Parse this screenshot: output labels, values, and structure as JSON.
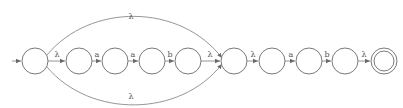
{
  "diagram": {
    "type": "finite-automaton",
    "colors": {
      "stroke": "#7a7a7a",
      "label": "#555555",
      "background": "#ffffff"
    },
    "states": [
      {
        "id": "q0",
        "cx": 35,
        "cy": 61,
        "initial": true,
        "final": false
      },
      {
        "id": "q1",
        "cx": 79,
        "cy": 61,
        "initial": false,
        "final": false
      },
      {
        "id": "q2",
        "cx": 115,
        "cy": 61,
        "initial": false,
        "final": false
      },
      {
        "id": "q3",
        "cx": 152,
        "cy": 61,
        "initial": false,
        "final": false
      },
      {
        "id": "q4",
        "cx": 188,
        "cy": 61,
        "initial": false,
        "final": false
      },
      {
        "id": "q5",
        "cx": 234,
        "cy": 61,
        "initial": false,
        "final": false
      },
      {
        "id": "q6",
        "cx": 272,
        "cy": 61,
        "initial": false,
        "final": false
      },
      {
        "id": "q7",
        "cx": 309,
        "cy": 61,
        "initial": false,
        "final": false
      },
      {
        "id": "q8",
        "cx": 345,
        "cy": 61,
        "initial": false,
        "final": false
      },
      {
        "id": "q9",
        "cx": 384,
        "cy": 61,
        "initial": false,
        "final": true
      }
    ],
    "transitions": [
      {
        "from": "q0",
        "to": "q1",
        "label": "λ"
      },
      {
        "from": "q1",
        "to": "q2",
        "label": "a"
      },
      {
        "from": "q2",
        "to": "q3",
        "label": "a"
      },
      {
        "from": "q3",
        "to": "q4",
        "label": "b"
      },
      {
        "from": "q4",
        "to": "q5",
        "label": "λ"
      },
      {
        "from": "q5",
        "to": "q6",
        "label": "λ"
      },
      {
        "from": "q6",
        "to": "q7",
        "label": "a"
      },
      {
        "from": "q7",
        "to": "q8",
        "label": "b"
      },
      {
        "from": "q8",
        "to": "q9",
        "label": "λ"
      },
      {
        "from": "q0",
        "to": "q5",
        "label": "λ",
        "curve": "upper"
      },
      {
        "from": "q0",
        "to": "q5",
        "label": "λ",
        "curve": "lower"
      }
    ],
    "labels": {
      "t01": "λ",
      "t12": "a",
      "t23": "a",
      "t34": "b",
      "t45": "λ",
      "t56": "λ",
      "t67": "a",
      "t78": "b",
      "t89": "λ",
      "upper_arc": "λ",
      "lower_arc": "λ"
    }
  }
}
